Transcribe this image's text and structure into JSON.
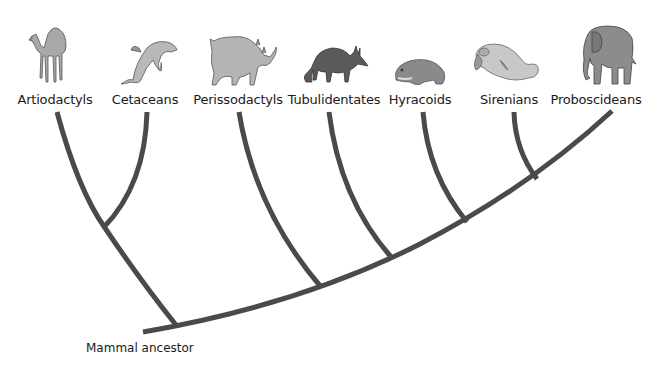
{
  "diagram": {
    "type": "cladogram",
    "root_label": "Mammal ancestor",
    "line_color": "#4a4a4a",
    "taxa": [
      {
        "label": "Artiodactyls",
        "animal-icon": "camel",
        "x": 55
      },
      {
        "label": "Cetaceans",
        "animal-icon": "dolphin",
        "x": 145
      },
      {
        "label": "Perissodactyls",
        "animal-icon": "rhinoceros",
        "x": 238
      },
      {
        "label": "Tubulidentates",
        "animal-icon": "aardvark",
        "x": 334
      },
      {
        "label": "Hyracoids",
        "animal-icon": "hyrax",
        "x": 420
      },
      {
        "label": "Sirenians",
        "animal-icon": "manatee",
        "x": 509
      },
      {
        "label": "Proboscideans",
        "animal-icon": "elephant",
        "x": 596
      }
    ],
    "topology": "((Artiodactyls, Cetaceans), (Perissodactyls, (Tubulidentates, (Hyracoids, (Sirenians, Proboscideans)))))"
  }
}
